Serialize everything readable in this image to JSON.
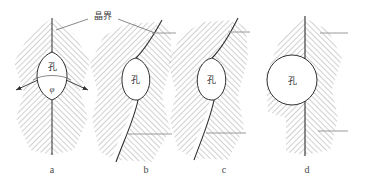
{
  "figure": {
    "title_label": "晶界",
    "title_label_meaning": "grain boundary",
    "leader_lines": 2,
    "panels": [
      {
        "id": "a",
        "caption": "a",
        "pore_label": "孔",
        "angle_label": "φ",
        "boundary_type": "straight-vertical",
        "pore_shape": "lens",
        "description": "Pore on a straight grain boundary with dihedral angle phi"
      },
      {
        "id": "b",
        "caption": "b",
        "pore_label": "孔",
        "angle_label": "",
        "boundary_type": "curved",
        "pore_shape": "lens",
        "description": "Pore on a curved grain boundary, boundary bowed"
      },
      {
        "id": "c",
        "caption": "c",
        "pore_label": "孔",
        "angle_label": "",
        "boundary_type": "curved",
        "pore_shape": "lens-rounded",
        "description": "Pore on a more strongly curved grain boundary"
      },
      {
        "id": "d",
        "caption": "d",
        "pore_label": "孔",
        "angle_label": "",
        "boundary_type": "straight-vertical",
        "pore_shape": "circle",
        "description": "Spherical pore detached from the straight grain boundary"
      }
    ],
    "colors": {
      "line": "#2e2e2e",
      "hatch": "#8a8a8a",
      "tick": "#9a9a9a",
      "caption": "#4a4a4a"
    }
  }
}
